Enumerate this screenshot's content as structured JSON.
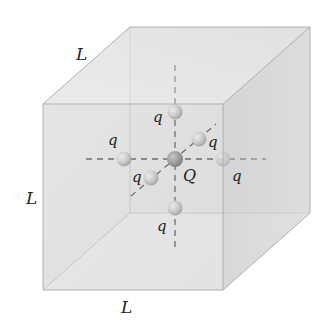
{
  "diagram": {
    "type": "cube-with-charges",
    "edge_labels": [
      {
        "id": "top-edge",
        "text": "L",
        "x": 76,
        "y": 60
      },
      {
        "id": "left-edge",
        "text": "L",
        "x": 30,
        "y": 204
      },
      {
        "id": "bottom-edge",
        "text": "L",
        "x": 124,
        "y": 310
      }
    ],
    "center_charge": {
      "label": "Q",
      "x": 175,
      "y": 159,
      "label_x": 183,
      "label_y": 180
    },
    "charges": [
      {
        "id": "top",
        "label": "q",
        "x": 175,
        "y": 112,
        "label_x": 154,
        "label_y": 122
      },
      {
        "id": "bottom",
        "label": "q",
        "x": 175,
        "y": 208,
        "label_x": 157,
        "label_y": 230
      },
      {
        "id": "left",
        "label": "q",
        "x": 124,
        "y": 159,
        "label_x": 109,
        "label_y": 144
      },
      {
        "id": "right",
        "label": "q",
        "x": 223,
        "y": 159,
        "label_x": 232,
        "label_y": 181
      },
      {
        "id": "back",
        "label": "q",
        "x": 199,
        "y": 139,
        "label_x": 210,
        "label_y": 148
      },
      {
        "id": "front",
        "label": "q",
        "x": 151,
        "y": 178,
        "label_x": 133,
        "label_y": 182
      }
    ],
    "colors": {
      "front_face": "#d8d8d8",
      "top_face": "#e6e6e6",
      "side_face": "#cfcfcf",
      "edge": "#b5b5b5",
      "axis_dash": "#333333",
      "center_sphere": "#808080",
      "outer_sphere": "#c4c4c4"
    }
  }
}
